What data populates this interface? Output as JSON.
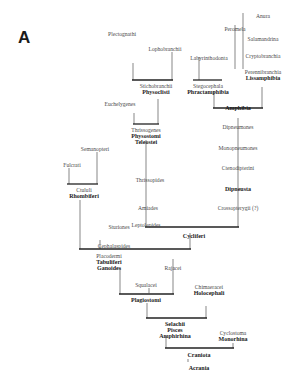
{
  "panel": "A",
  "taxa": {
    "pleroognathi": "Plectognathi",
    "lophobranchii": "Lophobranchii",
    "stichobranchii": "Stichobranchii",
    "physoclisti": "Physoclisti",
    "euchelygenes": "Euchelygenes",
    "thrissogenes": "Thrissogenes",
    "physostomi": "Physostomi",
    "teleostei": "Teleostei",
    "semanopteri": "Semanopteri",
    "fulcrati": "Fulcrati",
    "thrissopides": "Thrissopides",
    "amiades": "Amiades",
    "leptolepides": "Leptolepides",
    "ctululi": "Ctululi",
    "rhombiferi": "Rhombiferi",
    "sturiones": "Sturiones",
    "cephalaspides": "Cephalaspides",
    "cycliferi": "Cycliferi",
    "placodermi": "Placodermi",
    "tabuliferi": "Tabuliferi",
    "ganoides": "Ganoides",
    "rajacei": "Rajacei",
    "squalacei": "Squalacei",
    "chimaeracei": "Chimaeracei",
    "holocephali": "Holocephali",
    "plagiostomi": "Plagiostomi",
    "selachii": "Selachii",
    "pisces": "Pisces",
    "amphirhina": "Amphirhina",
    "cyclostoma": "Cyclostoma",
    "monorhina": "Monorhina",
    "craniota": "Craniota",
    "acrania": "Acrania",
    "anura": "Anura",
    "peromela": "Peromela",
    "salamandrina": "Salamandrina",
    "cryptobranchia": "Cryptobranchia",
    "labyrinthodonta": "Labyrinthodonta",
    "perennibranchia": "Perennibranchia",
    "lissamphibia": "Lissamphibia",
    "stegocephala": "Stegocephala",
    "phractamphibia": "Phractamphibia",
    "amphibia": "Amphibia",
    "dipneumones": "Dipneumones",
    "monopneumones": "Monopneumones",
    "ctenodipterini": "Ctenodipterini",
    "dipneusta": "Dipneusta",
    "crossopterygii": "Crossopterygii (?)"
  }
}
